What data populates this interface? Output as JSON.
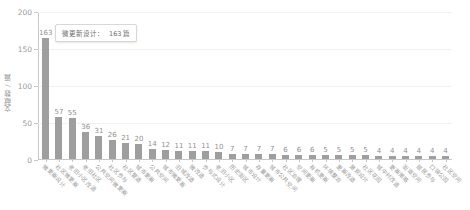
{
  "chart_data": {
    "type": "bar",
    "title": "",
    "xlabel": "",
    "ylabel": "文献数 / 篇",
    "ylim": [
      0,
      200
    ],
    "yticks": [
      0,
      50,
      100,
      150,
      200
    ],
    "grid": true,
    "legend": null,
    "bar_color": "#9e9e9e",
    "categories": [
      "微更新设计",
      "社区微更新",
      "老旧小区改造",
      "老旧社区",
      "公共空间微更新",
      "社区参与",
      "社区营造",
      "城市更新",
      "公共空间",
      "城市微更新",
      "旧城改造",
      "微改造",
      "参与式设计",
      "老旧小区",
      "历史街区",
      "城市设计",
      "存量更新",
      "城市公共空间",
      "社区治理",
      "空间更新",
      "有机更新",
      "环境整治",
      "更新改造",
      "景观设计",
      "社区花园",
      "城中村改造",
      "更新策略",
      "街道空间",
      "居民参与",
      "口袋公园",
      "社区空间"
    ],
    "values": [
      163,
      57,
      55,
      36,
      31,
      26,
      21,
      20,
      14,
      12,
      11,
      11,
      11,
      10,
      7,
      7,
      7,
      7,
      6,
      6,
      6,
      5,
      5,
      5,
      5,
      4,
      4,
      4,
      4,
      4,
      4
    ]
  },
  "tooltip": {
    "label": "微更新设计：",
    "value": "163 篇"
  }
}
